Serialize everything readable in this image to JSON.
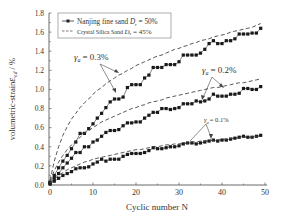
{
  "chart_data": {
    "type": "line",
    "title": "",
    "xlabel": "Cyclic number  N",
    "ylabel": "volumetric-strain ε_v,d / %",
    "xlim": [
      0,
      50
    ],
    "ylim": [
      0.0,
      1.8
    ],
    "xticks": [
      "0",
      "10",
      "20",
      "30",
      "40",
      "50"
    ],
    "yticks": [
      "0.0",
      "0.2",
      "0.4",
      "0.6",
      "0.8",
      "1.0",
      "1.2",
      "1.4",
      "1.6",
      "1.8"
    ],
    "grid": false,
    "legend": {
      "position": "upper-left",
      "entries": [
        {
          "label": "Nanjing fine sand D_r = 50%",
          "style": "line-square-markers"
        },
        {
          "label": "Crystal Silica Sand  D_r = 45%",
          "style": "dashed"
        }
      ]
    },
    "annotations": [
      {
        "text": "γa = 0.3%",
        "x": 4.5,
        "y": 1.22
      },
      {
        "text": "γa = 0.2%",
        "x": 37,
        "y": 1.17
      },
      {
        "text": "γa = 0.1%",
        "x": 34,
        "y": 0.61
      }
    ],
    "x": [
      0,
      1,
      2,
      3,
      4,
      5,
      6,
      7,
      8,
      9,
      10,
      11,
      12,
      13,
      14,
      15,
      16,
      17,
      18,
      19,
      20,
      21,
      22,
      23,
      24,
      25,
      26,
      27,
      28,
      29,
      30,
      31,
      32,
      33,
      34,
      35,
      36,
      37,
      38,
      39,
      40,
      41,
      42,
      43,
      44,
      45,
      46,
      47,
      48,
      49
    ],
    "series": [
      {
        "name": "Nanjing fine sand γa=0.3%",
        "kind": "markers",
        "values": [
          0.03,
          0.1,
          0.18,
          0.25,
          0.31,
          0.38,
          0.45,
          0.54,
          0.54,
          0.59,
          0.64,
          0.7,
          0.75,
          0.81,
          0.87,
          0.9,
          0.9,
          0.92,
          1.02,
          1.05,
          1.05,
          1.05,
          1.12,
          1.15,
          1.23,
          1.23,
          1.23,
          1.26,
          1.26,
          1.26,
          1.29,
          1.36,
          1.36,
          1.36,
          1.36,
          1.38,
          1.42,
          1.48,
          1.51,
          1.48,
          1.48,
          1.51,
          1.51,
          1.53,
          1.58,
          1.58,
          1.58,
          1.59,
          1.59,
          1.64
        ]
      },
      {
        "name": "Nanjing fine sand γa=0.2%",
        "kind": "markers",
        "values": [
          0.02,
          0.07,
          0.12,
          0.18,
          0.23,
          0.28,
          0.34,
          0.34,
          0.4,
          0.4,
          0.45,
          0.47,
          0.51,
          0.55,
          0.57,
          0.57,
          0.58,
          0.62,
          0.65,
          0.65,
          0.66,
          0.66,
          0.7,
          0.73,
          0.76,
          0.76,
          0.8,
          0.8,
          0.79,
          0.8,
          0.81,
          0.85,
          0.85,
          0.85,
          0.88,
          0.87,
          0.88,
          0.9,
          0.95,
          0.93,
          0.93,
          0.93,
          0.95,
          0.95,
          0.96,
          1.01,
          1.01,
          1.0,
          1.0,
          1.03
        ]
      },
      {
        "name": "Nanjing fine sand γa=0.1%",
        "kind": "markers",
        "values": [
          0.01,
          0.04,
          0.07,
          0.1,
          0.12,
          0.14,
          0.17,
          0.18,
          0.18,
          0.19,
          0.22,
          0.24,
          0.27,
          0.25,
          0.27,
          0.27,
          0.27,
          0.3,
          0.32,
          0.33,
          0.33,
          0.33,
          0.34,
          0.36,
          0.39,
          0.38,
          0.38,
          0.39,
          0.4,
          0.4,
          0.41,
          0.43,
          0.44,
          0.44,
          0.43,
          0.44,
          0.45,
          0.46,
          0.47,
          0.46,
          0.47,
          0.47,
          0.48,
          0.49,
          0.5,
          0.51,
          0.5,
          0.5,
          0.51,
          0.52
        ]
      },
      {
        "name": "Crystal Silica Sand γa=0.3%",
        "kind": "dashed",
        "values": [
          0.05,
          0.25,
          0.4,
          0.52,
          0.61,
          0.69,
          0.75,
          0.81,
          0.86,
          0.9,
          0.95,
          0.99,
          1.02,
          1.06,
          1.09,
          1.12,
          1.15,
          1.17,
          1.2,
          1.22,
          1.25,
          1.27,
          1.29,
          1.31,
          1.33,
          1.35,
          1.36,
          1.38,
          1.4,
          1.42,
          1.43,
          1.45,
          1.46,
          1.48,
          1.49,
          1.51,
          1.52,
          1.53,
          1.55,
          1.56,
          1.57,
          1.58,
          1.6,
          1.61,
          1.62,
          1.63,
          1.64,
          1.65,
          1.67,
          1.69
        ]
      },
      {
        "name": "Crystal Silica Sand γa=0.2%",
        "kind": "dashed",
        "values": [
          0.04,
          0.15,
          0.24,
          0.31,
          0.37,
          0.42,
          0.46,
          0.5,
          0.54,
          0.57,
          0.6,
          0.63,
          0.66,
          0.68,
          0.7,
          0.72,
          0.74,
          0.76,
          0.78,
          0.8,
          0.81,
          0.83,
          0.84,
          0.86,
          0.87,
          0.88,
          0.89,
          0.91,
          0.92,
          0.93,
          0.94,
          0.95,
          0.96,
          0.97,
          0.98,
          0.99,
          1.0,
          1.01,
          1.02,
          1.02,
          1.03,
          1.04,
          1.05,
          1.06,
          1.07,
          1.07,
          1.08,
          1.09,
          1.1,
          1.11
        ]
      },
      {
        "name": "Crystal Silica Sand γa=0.1%",
        "kind": "dashed",
        "values": [
          0.02,
          0.06,
          0.1,
          0.13,
          0.16,
          0.18,
          0.2,
          0.22,
          0.24,
          0.25,
          0.27,
          0.28,
          0.29,
          0.3,
          0.31,
          0.32,
          0.33,
          0.34,
          0.35,
          0.36,
          0.37,
          0.37,
          0.38,
          0.39,
          0.4,
          0.4,
          0.41,
          0.42,
          0.42,
          0.43,
          0.43,
          0.44,
          0.44,
          0.45,
          0.45,
          0.46,
          0.46,
          0.47,
          0.47,
          0.47,
          0.48,
          0.48,
          0.49,
          0.49,
          0.49,
          0.5,
          0.5,
          0.5,
          0.51,
          0.51
        ]
      }
    ]
  },
  "labels": {
    "xlabel": "Cyclic number  N",
    "ylabel_prefix": "volumetric-strain",
    "ylabel_eps": "ε",
    "ylabel_sub": "v,d",
    "ylabel_suffix": " / %",
    "legend_1": "Nanjing fine sand",
    "legend_1_dr": "D",
    "legend_1_val": " = 50%",
    "legend_2": "Crystal Silica Sand",
    "legend_2_dr": "D",
    "legend_2_val": " = 45%",
    "legend_dr_sub": "r",
    "ann_03": "= 0.3%",
    "ann_02": "= 0.2%",
    "ann_01": "= 0.1%",
    "gamma": "γ",
    "gamma_sub": "a"
  }
}
